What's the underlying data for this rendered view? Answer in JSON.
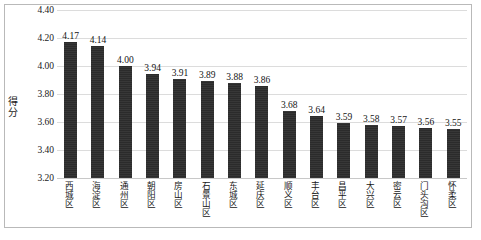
{
  "chart_data": {
    "type": "bar",
    "title": "",
    "xlabel": "",
    "ylabel": "得分",
    "ylim": [
      3.2,
      4.4
    ],
    "ytick_step": 0.2,
    "yticks": [
      "4.40",
      "4.20",
      "4.00",
      "3.80",
      "3.60",
      "3.40",
      "3.20"
    ],
    "grid": true,
    "legend": "none",
    "bar_color": "#2b2b2b",
    "gridline_color": "#dcdcdc",
    "frame_color": "#b9b9b9",
    "categories": [
      "西城区",
      "海淀区",
      "通州区",
      "朝阳区",
      "房山区",
      "石景山区",
      "东城区",
      "延庆区",
      "顺义区",
      "丰台区",
      "昌平区",
      "大兴区",
      "密云区",
      "门头沟区",
      "怀柔区"
    ],
    "values": [
      4.17,
      4.14,
      4.0,
      3.94,
      3.91,
      3.89,
      3.88,
      3.86,
      3.68,
      3.64,
      3.59,
      3.58,
      3.57,
      3.56,
      3.55
    ],
    "value_labels": [
      "4.17",
      "4.14",
      "4.00",
      "3.94",
      "3.91",
      "3.89",
      "3.88",
      "3.86",
      "3.68",
      "3.64",
      "3.59",
      "3.58",
      "3.57",
      "3.56",
      "3.55"
    ]
  }
}
